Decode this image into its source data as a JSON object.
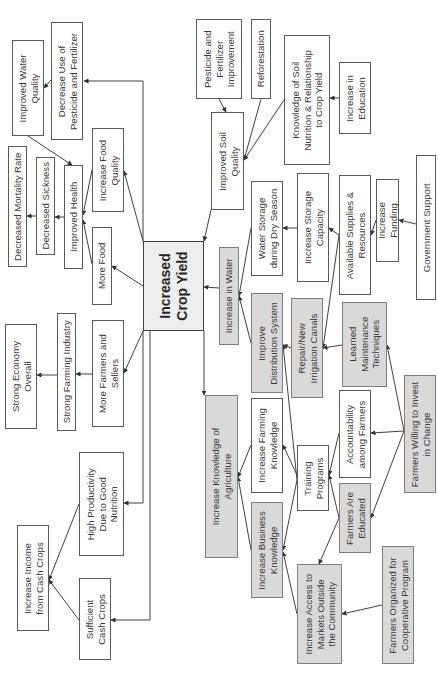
{
  "diagram": {
    "title": "Increased Crop Yield",
    "colors": {
      "white_fill": "#ffffff",
      "gray_fill": "#d9d9d9",
      "core_fill": "#eeeeee",
      "line": "#404040"
    },
    "nodes": [
      {
        "id": "core",
        "text": "Increased\nCrop Yield",
        "style": "core",
        "x": 143,
        "y": 241,
        "w": 61,
        "h": 90
      },
      {
        "id": "improved_water_quality",
        "text": "Improved Water\nQuality",
        "style": "white",
        "x": 12,
        "y": 40,
        "w": 32,
        "h": 96
      },
      {
        "id": "decrease_pesticide",
        "text": "Decrease Use of\nPesticide and Fertilizer",
        "style": "white",
        "x": 51,
        "y": 22,
        "w": 32,
        "h": 118
      },
      {
        "id": "decreased_mortality",
        "text": "Decreased Mortality Rate",
        "style": "white",
        "x": 8,
        "y": 146,
        "w": 19,
        "h": 121
      },
      {
        "id": "decreased_sickness",
        "text": "Decreased Sickness",
        "style": "white",
        "x": 36,
        "y": 157,
        "w": 19,
        "h": 98
      },
      {
        "id": "improved_health",
        "text": "Improved Health",
        "style": "white",
        "x": 64,
        "y": 165,
        "w": 19,
        "h": 104
      },
      {
        "id": "increase_food_quality",
        "text": "Increase Food\nQuality",
        "style": "white",
        "x": 92,
        "y": 128,
        "w": 32,
        "h": 84
      },
      {
        "id": "more_food",
        "text": "More Food",
        "style": "white",
        "x": 92,
        "y": 227,
        "w": 20,
        "h": 78
      },
      {
        "id": "strong_economy",
        "text": "Strong Economy\nOverall",
        "style": "white",
        "x": 5,
        "y": 324,
        "w": 32,
        "h": 105
      },
      {
        "id": "strong_farming",
        "text": "Strong Farming Industry",
        "style": "white",
        "x": 57,
        "y": 313,
        "w": 19,
        "h": 118
      },
      {
        "id": "more_farmers",
        "text": "More Farmers and\nSellers",
        "style": "white",
        "x": 92,
        "y": 320,
        "w": 32,
        "h": 107
      },
      {
        "id": "high_productivity",
        "text": "High Productivity\nDue to Good\nNutrition",
        "style": "white",
        "x": 79,
        "y": 452,
        "w": 45,
        "h": 104
      },
      {
        "id": "increase_income",
        "text": "Increase Income\nfrom Cash Crops",
        "style": "white",
        "x": 17,
        "y": 525,
        "w": 32,
        "h": 106
      },
      {
        "id": "sufficient_cash",
        "text": "Sufficient\nCash Crops",
        "style": "white",
        "x": 79,
        "y": 578,
        "w": 32,
        "h": 82
      },
      {
        "id": "pesticide_improvement",
        "text": "Pesticide and\nFertilizer\nImprovement",
        "style": "white",
        "x": 196,
        "y": 19,
        "w": 46,
        "h": 80
      },
      {
        "id": "reforestation",
        "text": "Reforestation",
        "style": "white",
        "x": 251,
        "y": 19,
        "w": 20,
        "h": 80
      },
      {
        "id": "improved_soil",
        "text": "Improved Soil\nQuality",
        "style": "white",
        "x": 211,
        "y": 112,
        "w": 33,
        "h": 98
      },
      {
        "id": "knowledge_soil",
        "text": "Knowledge of Soil\nNutrition & Relationship\nto Crop Yield",
        "style": "white",
        "x": 284,
        "y": 35,
        "w": 46,
        "h": 130
      },
      {
        "id": "increase_education",
        "text": "Increase in\nEducation",
        "style": "white",
        "x": 339,
        "y": 62,
        "w": 32,
        "h": 72
      },
      {
        "id": "water_storage",
        "text": "Water Storage\nduring Dry Season",
        "style": "white",
        "x": 251,
        "y": 181,
        "w": 32,
        "h": 95
      },
      {
        "id": "increase_storage",
        "text": "Increase Storage\nCapacity",
        "style": "white",
        "x": 297,
        "y": 173,
        "w": 32,
        "h": 109
      },
      {
        "id": "available_supplies",
        "text": "Available Supplies &\nResources",
        "style": "white",
        "x": 339,
        "y": 175,
        "w": 32,
        "h": 120
      },
      {
        "id": "increase_funding",
        "text": "Increase\nFunding",
        "style": "white",
        "x": 376,
        "y": 179,
        "w": 23,
        "h": 83
      },
      {
        "id": "government_support",
        "text": "Government Support",
        "style": "white",
        "x": 416,
        "y": 155,
        "w": 20,
        "h": 145
      },
      {
        "id": "increase_in_water",
        "text": "Increase in Water",
        "style": "gray",
        "x": 219,
        "y": 247,
        "w": 20,
        "h": 98
      },
      {
        "id": "improve_distribution",
        "text": "Improve\nDistribution System",
        "style": "gray",
        "x": 251,
        "y": 293,
        "w": 32,
        "h": 100
      },
      {
        "id": "repair_canals",
        "text": "Repair/New\nIrrigation Canals",
        "style": "gray",
        "x": 291,
        "y": 298,
        "w": 32,
        "h": 100
      },
      {
        "id": "learned_maintenance",
        "text": "Learned\nMaintenance\nTechniques",
        "style": "gray",
        "x": 342,
        "y": 302,
        "w": 45,
        "h": 85
      },
      {
        "id": "farmers_willing",
        "text": "Farmers Willing to Invest\nin Change",
        "style": "gray",
        "x": 404,
        "y": 375,
        "w": 32,
        "h": 118
      },
      {
        "id": "increase_knowledge_ag",
        "text": "Increase Knowledge of\nAgriculture",
        "style": "gray",
        "x": 205,
        "y": 395,
        "w": 33,
        "h": 163
      },
      {
        "id": "increase_farming_knowledge",
        "text": "Increase Farming\nKnowledge",
        "style": "white",
        "x": 251,
        "y": 398,
        "w": 32,
        "h": 95
      },
      {
        "id": "training_programs",
        "text": "Training\nPrograms",
        "style": "white",
        "x": 297,
        "y": 445,
        "w": 32,
        "h": 66
      },
      {
        "id": "accountability",
        "text": "Accountability\namong Farmers",
        "style": "white",
        "x": 339,
        "y": 390,
        "w": 32,
        "h": 88
      },
      {
        "id": "farmers_educated",
        "text": "Farmers Are\nEducated",
        "style": "gray",
        "x": 339,
        "y": 483,
        "w": 32,
        "h": 70
      },
      {
        "id": "increase_business",
        "text": "Increase Business\nKnowledge",
        "style": "gray",
        "x": 251,
        "y": 502,
        "w": 32,
        "h": 96
      },
      {
        "id": "increase_access",
        "text": "Increase Access to\nMarkets Outside\nthe Community",
        "style": "gray",
        "x": 297,
        "y": 564,
        "w": 45,
        "h": 100
      },
      {
        "id": "farmers_organized",
        "text": "Farmers Organized for\nCooperative Program",
        "style": "gray",
        "x": 382,
        "y": 546,
        "w": 32,
        "h": 118
      }
    ],
    "edges": [
      {
        "from": "core",
        "to": "decrease_pesticide",
        "points": [
          [
            143,
            241
          ],
          [
            143,
            81
          ],
          [
            84,
            81
          ]
        ]
      },
      {
        "from": "decrease_pesticide",
        "to": "improved_water_quality",
        "points": [
          [
            51,
            80
          ],
          [
            44,
            88
          ]
        ]
      },
      {
        "from": "improved_water_quality",
        "to": "improved_health",
        "points": [
          [
            28,
            136
          ],
          [
            72,
            165
          ]
        ]
      },
      {
        "from": "improved_health",
        "to": "decreased_sickness",
        "points": [
          [
            64,
            217
          ],
          [
            55,
            217
          ]
        ]
      },
      {
        "from": "decreased_sickness",
        "to": "decreased_mortality",
        "points": [
          [
            36,
            216
          ],
          [
            27,
            216
          ]
        ]
      },
      {
        "from": "increase_food_quality",
        "to": "improved_health",
        "points": [
          [
            92,
            170
          ],
          [
            83,
            215
          ]
        ]
      },
      {
        "from": "more_food",
        "to": "improved_health",
        "points": [
          [
            92,
            264
          ],
          [
            83,
            220
          ]
        ]
      },
      {
        "from": "core",
        "to": "increase_food_quality",
        "points": [
          [
            143,
            241
          ],
          [
            124,
            171
          ]
        ]
      },
      {
        "from": "core",
        "to": "more_food",
        "points": [
          [
            143,
            286
          ],
          [
            112,
            266
          ]
        ]
      },
      {
        "from": "core",
        "to": "more_farmers",
        "points": [
          [
            143,
            331
          ],
          [
            124,
            373
          ]
        ]
      },
      {
        "from": "more_farmers",
        "to": "strong_farming",
        "points": [
          [
            92,
            374
          ],
          [
            76,
            374
          ]
        ]
      },
      {
        "from": "strong_farming",
        "to": "strong_economy",
        "points": [
          [
            57,
            375
          ],
          [
            37,
            375
          ]
        ]
      },
      {
        "from": "core",
        "to": "high_productivity",
        "points": [
          [
            143,
            331
          ],
          [
            143,
            503
          ],
          [
            124,
            503
          ]
        ]
      },
      {
        "from": "core",
        "to": "sufficient_cash",
        "points": [
          [
            150,
            331
          ],
          [
            150,
            620
          ],
          [
            111,
            620
          ]
        ]
      },
      {
        "from": "high_productivity",
        "to": "increase_income",
        "points": [
          [
            79,
            504
          ],
          [
            49,
            580
          ]
        ]
      },
      {
        "from": "sufficient_cash",
        "to": "increase_income",
        "points": [
          [
            79,
            620
          ],
          [
            49,
            580
          ]
        ]
      },
      {
        "from": "improved_soil",
        "to": "core",
        "points": [
          [
            211,
            210
          ],
          [
            204,
            241
          ]
        ]
      },
      {
        "from": "pesticide_improvement",
        "to": "improved_soil",
        "points": [
          [
            219,
            99
          ],
          [
            226,
            112
          ]
        ]
      },
      {
        "from": "reforestation",
        "to": "improved_soil",
        "points": [
          [
            261,
            99
          ],
          [
            244,
            160
          ]
        ]
      },
      {
        "from": "knowledge_soil",
        "to": "improved_soil",
        "points": [
          [
            284,
            100
          ],
          [
            244,
            160
          ]
        ]
      },
      {
        "from": "increase_education",
        "to": "knowledge_soil",
        "points": [
          [
            339,
            98
          ],
          [
            330,
            98
          ]
        ]
      },
      {
        "from": "increase_in_water",
        "to": "core",
        "points": [
          [
            219,
            288
          ],
          [
            204,
            287
          ]
        ]
      },
      {
        "from": "water_storage",
        "to": "increase_in_water",
        "points": [
          [
            251,
            228
          ],
          [
            239,
            296
          ]
        ]
      },
      {
        "from": "improve_distribution",
        "to": "increase_in_water",
        "points": [
          [
            251,
            343
          ],
          [
            239,
            296
          ]
        ]
      },
      {
        "from": "increase_storage",
        "to": "water_storage",
        "points": [
          [
            297,
            228
          ],
          [
            283,
            228
          ]
        ]
      },
      {
        "from": "available_supplies",
        "to": "increase_storage",
        "points": [
          [
            339,
            235
          ],
          [
            329,
            228
          ]
        ]
      },
      {
        "from": "available_supplies",
        "to": "repair_canals",
        "points": [
          [
            339,
            235
          ],
          [
            323,
            348
          ]
        ]
      },
      {
        "from": "increase_funding",
        "to": "available_supplies",
        "points": [
          [
            376,
            220
          ],
          [
            371,
            235
          ]
        ]
      },
      {
        "from": "government_support",
        "to": "increase_funding",
        "points": [
          [
            416,
            224
          ],
          [
            399,
            220
          ]
        ]
      },
      {
        "from": "repair_canals",
        "to": "improve_distribution",
        "points": [
          [
            291,
            348
          ],
          [
            283,
            345
          ]
        ]
      },
      {
        "from": "learned_maintenance",
        "to": "repair_canals",
        "points": [
          [
            342,
            345
          ],
          [
            323,
            348
          ]
        ]
      },
      {
        "from": "farmers_willing",
        "to": "learned_maintenance",
        "points": [
          [
            404,
            431
          ],
          [
            387,
            345
          ]
        ]
      },
      {
        "from": "farmers_willing",
        "to": "accountability",
        "points": [
          [
            404,
            431
          ],
          [
            371,
            433
          ]
        ]
      },
      {
        "from": "farmers_willing",
        "to": "farmers_educated",
        "points": [
          [
            404,
            431
          ],
          [
            371,
            518
          ]
        ]
      },
      {
        "from": "training_programs",
        "to": "improve_distribution",
        "points": [
          [
            297,
            480
          ],
          [
            283,
            345
          ]
        ]
      },
      {
        "from": "training_programs",
        "to": "increase_farming_knowledge",
        "points": [
          [
            297,
            475
          ],
          [
            283,
            445
          ]
        ]
      },
      {
        "from": "training_programs",
        "to": "increase_business",
        "points": [
          [
            297,
            480
          ],
          [
            283,
            550
          ]
        ]
      },
      {
        "from": "accountability",
        "to": "training_programs",
        "points": [
          [
            339,
            433
          ],
          [
            329,
            475
          ]
        ]
      },
      {
        "from": "farmers_educated",
        "to": "training_programs",
        "points": [
          [
            339,
            518
          ],
          [
            329,
            475
          ]
        ]
      },
      {
        "from": "farmers_educated",
        "to": "increase_access",
        "points": [
          [
            339,
            518
          ],
          [
            319,
            564
          ]
        ]
      },
      {
        "from": "increase_farming_knowledge",
        "to": "increase_knowledge_ag",
        "points": [
          [
            251,
            445
          ],
          [
            238,
            477
          ]
        ]
      },
      {
        "from": "increase_business",
        "to": "increase_knowledge_ag",
        "points": [
          [
            251,
            550
          ],
          [
            238,
            477
          ]
        ]
      },
      {
        "from": "increase_access",
        "to": "increase_business",
        "points": [
          [
            297,
            614
          ],
          [
            283,
            552
          ]
        ]
      },
      {
        "from": "farmers_organized",
        "to": "increase_access",
        "points": [
          [
            382,
            605
          ],
          [
            342,
            614
          ]
        ]
      },
      {
        "from": "core",
        "to": "increase_knowledge_ag",
        "points": [
          [
            204,
            331
          ],
          [
            204,
            395
          ]
        ]
      }
    ]
  }
}
